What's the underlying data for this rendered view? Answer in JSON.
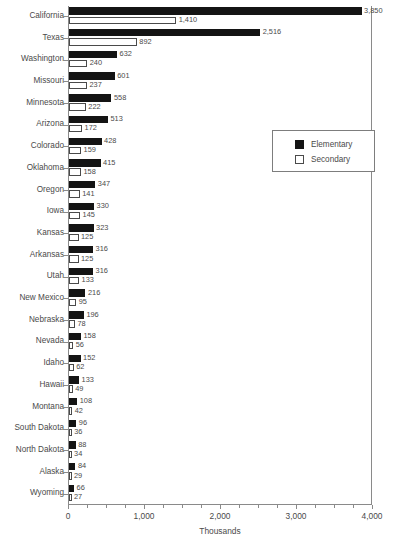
{
  "chart_data": {
    "type": "bar",
    "orientation": "horizontal",
    "title": "",
    "xlabel": "Thousands",
    "ylabel": "",
    "xlim": [
      0,
      4000
    ],
    "xticks": [
      0,
      1000,
      2000,
      3000,
      4000
    ],
    "xtick_labels": [
      "0",
      "1,000",
      "2,000",
      "3,000",
      "4,000"
    ],
    "grid": false,
    "legend_position": "upper-right-inset",
    "categories": [
      "California",
      "Texas",
      "Washington",
      "Missouri",
      "Minnesota",
      "Arizona",
      "Colorado",
      "Oklahoma",
      "Oregon",
      "Iowa",
      "Kansas",
      "Arkansas",
      "Utah",
      "New Mexico",
      "Nebraska",
      "Nevada",
      "Idaho",
      "Hawaii",
      "Montana",
      "South Dakota",
      "North Dakota",
      "Alaska",
      "Wyoming"
    ],
    "series": [
      {
        "name": "Elementary",
        "color": "#141414",
        "values": [
          3850,
          2516,
          632,
          601,
          558,
          513,
          428,
          415,
          347,
          330,
          323,
          316,
          316,
          216,
          196,
          158,
          152,
          133,
          108,
          96,
          88,
          84,
          66
        ],
        "labels": [
          "3,850",
          "2,516",
          "632",
          "601",
          "558",
          "513",
          "428",
          "415",
          "347",
          "330",
          "323",
          "316",
          "316",
          "216",
          "196",
          "158",
          "152",
          "133",
          "108",
          "96",
          "88",
          "84",
          "66"
        ]
      },
      {
        "name": "Secondary",
        "color": "#ffffff",
        "values": [
          1410,
          892,
          240,
          237,
          222,
          172,
          159,
          158,
          141,
          145,
          125,
          125,
          133,
          95,
          78,
          56,
          62,
          49,
          42,
          36,
          34,
          29,
          27
        ],
        "labels": [
          "1,410",
          "892",
          "240",
          "237",
          "222",
          "172",
          "159",
          "158",
          "141",
          "145",
          "125",
          "125",
          "133",
          "95",
          "78",
          "56",
          "62",
          "49",
          "42",
          "36",
          "34",
          "29",
          "27"
        ]
      }
    ]
  },
  "legend": {
    "items": [
      {
        "label": "Elementary",
        "swatch": "filled-square-icon"
      },
      {
        "label": "Secondary",
        "swatch": "hollow-square-icon"
      }
    ]
  },
  "axis": {
    "x_title": "Thousands"
  },
  "caption": ""
}
